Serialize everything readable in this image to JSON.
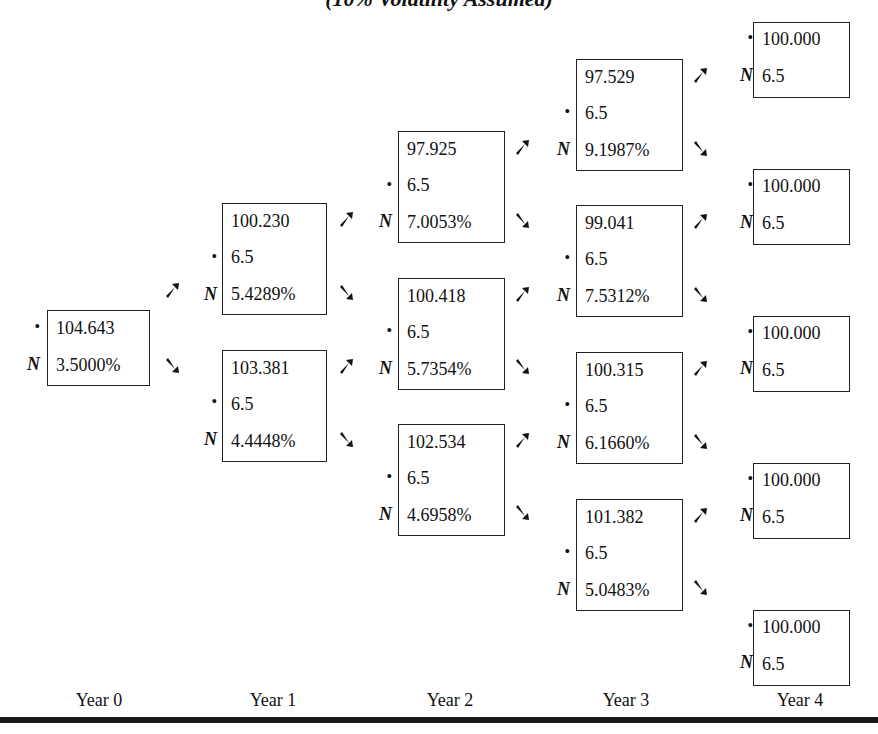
{
  "title": "(10% Volatility Assumed)",
  "labels": {
    "bullet": "•",
    "n": "N"
  },
  "years": [
    "Year 0",
    "Year 1",
    "Year 2",
    "Year 3",
    "Year 4"
  ],
  "nodes": {
    "y0": [
      {
        "value": "104.643",
        "rate": "3.5000%"
      }
    ],
    "y1": [
      {
        "value": "100.230",
        "coupon": "6.5",
        "rate": "5.4289%"
      },
      {
        "value": "103.381",
        "coupon": "6.5",
        "rate": "4.4448%"
      }
    ],
    "y2": [
      {
        "value": "97.925",
        "coupon": "6.5",
        "rate": "7.0053%"
      },
      {
        "value": "100.418",
        "coupon": "6.5",
        "rate": "5.7354%"
      },
      {
        "value": "102.534",
        "coupon": "6.5",
        "rate": "4.6958%"
      }
    ],
    "y3": [
      {
        "value": "97.529",
        "coupon": "6.5",
        "rate": "9.1987%"
      },
      {
        "value": "99.041",
        "coupon": "6.5",
        "rate": "7.5312%"
      },
      {
        "value": "100.315",
        "coupon": "6.5",
        "rate": "6.1660%"
      },
      {
        "value": "101.382",
        "coupon": "6.5",
        "rate": "5.0483%"
      }
    ],
    "y4": [
      {
        "value": "100.000",
        "coupon": "6.5"
      },
      {
        "value": "100.000",
        "coupon": "6.5"
      },
      {
        "value": "100.000",
        "coupon": "6.5"
      },
      {
        "value": "100.000",
        "coupon": "6.5"
      },
      {
        "value": "100.000",
        "coupon": "6.5"
      }
    ]
  },
  "colors": {
    "ink": "#111111",
    "background": "#ffffff",
    "bar": "#1a1a1a"
  }
}
